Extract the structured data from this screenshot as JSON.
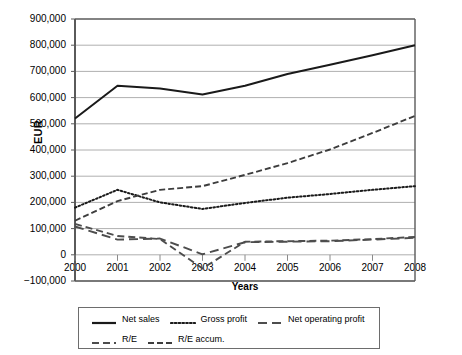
{
  "chart_data": {
    "type": "line",
    "title": "",
    "xlabel": "Years",
    "ylabel": "EUR",
    "categories": [
      "2000",
      "2001",
      "2002",
      "2003",
      "2004",
      "2005",
      "2006",
      "2007",
      "2008"
    ],
    "x": [
      2000,
      2001,
      2002,
      2003,
      2004,
      2005,
      2006,
      2007,
      2008
    ],
    "xlim": [
      2000,
      2008
    ],
    "ylim": [
      -100000,
      900000
    ],
    "ytick_labels": [
      "900,000",
      "800,000",
      "700,000",
      "600,000",
      "500,000",
      "400,000",
      "300,000",
      "200,000",
      "100,000",
      "0",
      "−100,000"
    ],
    "ytick_values": [
      900000,
      800000,
      700000,
      600000,
      500000,
      400000,
      300000,
      200000,
      100000,
      0,
      -100000
    ],
    "grid": "horizontal",
    "legend_position": "bottom",
    "series": [
      {
        "name": "Net sales",
        "style": "solid",
        "color": "#1a1a1a",
        "values": [
          520000,
          645000,
          635000,
          612000,
          645000,
          690000,
          725000,
          762000,
          800000
        ]
      },
      {
        "name": "Gross profit",
        "style": "dotted",
        "color": "#1a1a1a",
        "values": [
          180000,
          248000,
          200000,
          175000,
          198000,
          218000,
          232000,
          248000,
          262000
        ]
      },
      {
        "name": "Net operating profit",
        "style": "dashed-long",
        "color": "#4d4d4d",
        "values": [
          108000,
          58000,
          62000,
          2000,
          48000,
          50000,
          52000,
          58000,
          65000
        ]
      },
      {
        "name": "R/E",
        "style": "dashed-medium",
        "color": "#4d4d4d",
        "values": [
          118000,
          72000,
          60000,
          -52000,
          50000,
          52000,
          54000,
          60000,
          68000
        ]
      },
      {
        "name": "R/E accum.",
        "style": "dashed-dense",
        "color": "#3d3d3d",
        "values": [
          130000,
          205000,
          248000,
          262000,
          305000,
          350000,
          402000,
          465000,
          530000
        ]
      }
    ]
  }
}
